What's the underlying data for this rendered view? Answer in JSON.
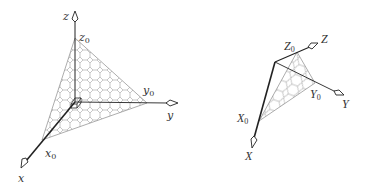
{
  "figure": {
    "colors": {
      "axis": "#222222",
      "mesh": "#9a9a9a",
      "edge": "#8a8a8a",
      "label": "#333333",
      "background": "#ffffff"
    },
    "left": {
      "title": "world axes with intercept plane",
      "origin": [
        75,
        102
      ],
      "axes": {
        "x": {
          "label": "x",
          "tip": [
            21,
            168
          ],
          "label_pos": [
            18,
            182
          ]
        },
        "y": {
          "label": "y",
          "tip": [
            178,
            103
          ],
          "label_pos": [
            167,
            119
          ]
        },
        "z": {
          "label": "z",
          "tip": [
            75,
            11
          ],
          "label_pos": [
            63,
            20
          ]
        }
      },
      "intercepts": {
        "x0": {
          "base": "x",
          "sub": "0",
          "point": [
            42,
            140
          ],
          "label_pos": [
            45,
            157
          ]
        },
        "y0": {
          "base": "y",
          "sub": "0",
          "point": [
            147,
            103
          ],
          "label_pos": [
            143,
            94
          ]
        },
        "z0": {
          "base": "z",
          "sub": "0",
          "point": [
            75,
            38
          ],
          "label_pos": [
            79,
            41
          ]
        }
      },
      "mesh": "truncated-square"
    },
    "right": {
      "title": "rotated axes with intercept plane",
      "origin": [
        275,
        62
      ],
      "axes": {
        "X": {
          "label": "X",
          "tip": [
            252,
            148
          ],
          "label_pos": [
            245,
            160
          ]
        },
        "Y": {
          "label": "Y",
          "tip": [
            344,
            95
          ],
          "label_pos": [
            342,
            108
          ]
        },
        "Z": {
          "label": "Z",
          "tip": [
            318,
            43
          ],
          "label_pos": [
            321,
            43
          ]
        }
      },
      "intercepts": {
        "X0": {
          "base": "X",
          "sub": "0",
          "point": [
            259,
            121
          ],
          "label_pos": [
            237,
            122
          ]
        },
        "Y0": {
          "base": "Y",
          "sub": "0",
          "point": [
            315,
            83
          ],
          "label_pos": [
            310,
            98
          ]
        },
        "Z0": {
          "base": "Z",
          "sub": "0",
          "point": [
            297,
            52
          ],
          "label_pos": [
            284,
            50
          ]
        }
      },
      "mesh": "hexagonal"
    }
  }
}
